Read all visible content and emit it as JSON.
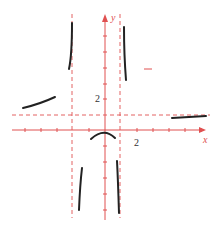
{
  "figure": {
    "type": "function-graph-sketch",
    "axes": {
      "x_label": "x",
      "y_label": "y",
      "x_tick_label": "2",
      "y_tick_label": "2",
      "origin_px": [
        105,
        130
      ],
      "unit_px": 16,
      "color": "#e05050"
    },
    "asymptotes": {
      "vertical_x": [
        -2,
        1
      ],
      "horizontal_y": 1,
      "style": "dashed",
      "color": "#e05050"
    },
    "curve_color": "#222222",
    "segments": [
      {
        "name": "left-branch",
        "note": "approaches y=1 from above as x→-∞"
      },
      {
        "name": "left-of-x-minus-2-up",
        "note": "rises to +∞ as x→-2⁻"
      },
      {
        "name": "right-of-x-minus-2-down",
        "note": "falls to -∞ as x→-2⁺"
      },
      {
        "name": "middle-hump",
        "note": "local max near origin, below x-axis"
      },
      {
        "name": "left-of-x-1-down",
        "note": "falls to -∞ as x→1⁻"
      },
      {
        "name": "right-of-x-1-up",
        "note": "descends from +∞ as x→1⁺"
      },
      {
        "name": "right-branch",
        "note": "approaches y=1 from below/near as x→+∞"
      }
    ]
  }
}
